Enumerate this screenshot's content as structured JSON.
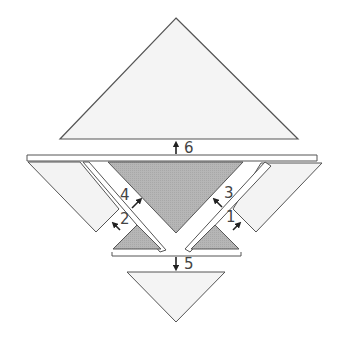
{
  "diagram": {
    "colors": {
      "background": "#ffffff",
      "light_fill": "#f3f3f3",
      "dark_fill": "#b4b4b4",
      "stroke": "#555555",
      "arrow": "#222222",
      "label": "#444444"
    },
    "pieces": {
      "top_triangle": "large light triangle (top)",
      "bottom_triangle": "small light inverted triangle (bottom)",
      "center_triangle": "large dark inverted triangle (center)",
      "left_small_triangle": "small dark triangle (lower left)",
      "right_small_triangle": "small dark triangle (lower right)",
      "left_parallelogram": "light parallelogram (left)",
      "right_parallelogram": "light parallelogram (right)",
      "left_strip": "thin diagonal strip (left)",
      "right_strip": "thin diagonal strip (right)",
      "top_bar": "horizontal bar (top)",
      "bottom_bar": "horizontal bar (bottom)"
    },
    "labels": {
      "l1": "1",
      "l2": "2",
      "l3": "3",
      "l4": "4",
      "l5": "5",
      "l6": "6"
    }
  }
}
